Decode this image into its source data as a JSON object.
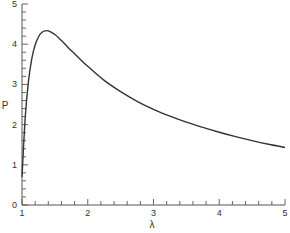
{
  "chart_data": {
    "type": "line",
    "title": "",
    "xlabel": "λ",
    "ylabel": "P",
    "xlim": [
      1,
      5
    ],
    "ylim": [
      0,
      5
    ],
    "x_ticks": [
      "1",
      "2",
      "3",
      "4",
      "5"
    ],
    "y_ticks": [
      "0",
      "1",
      "2",
      "3",
      "4",
      "5"
    ],
    "x_minor_step": 0.2,
    "y_minor_step": 0.2,
    "grid": false,
    "legend": null,
    "series": [
      {
        "name": "P(λ)",
        "color": "#333333",
        "x": [
          1.0,
          1.05,
          1.1,
          1.15,
          1.2,
          1.25,
          1.3,
          1.35,
          1.4,
          1.5,
          1.6,
          1.7,
          1.8,
          1.9,
          2.0,
          2.25,
          2.5,
          2.75,
          3.0,
          3.25,
          3.5,
          3.75,
          4.0,
          4.25,
          4.5,
          4.75,
          5.0
        ],
        "y": [
          0.7,
          2.2,
          3.1,
          3.65,
          3.98,
          4.18,
          4.29,
          4.33,
          4.33,
          4.24,
          4.09,
          3.92,
          3.76,
          3.6,
          3.45,
          3.1,
          2.82,
          2.58,
          2.38,
          2.21,
          2.06,
          1.93,
          1.81,
          1.7,
          1.6,
          1.51,
          1.43
        ]
      }
    ]
  }
}
